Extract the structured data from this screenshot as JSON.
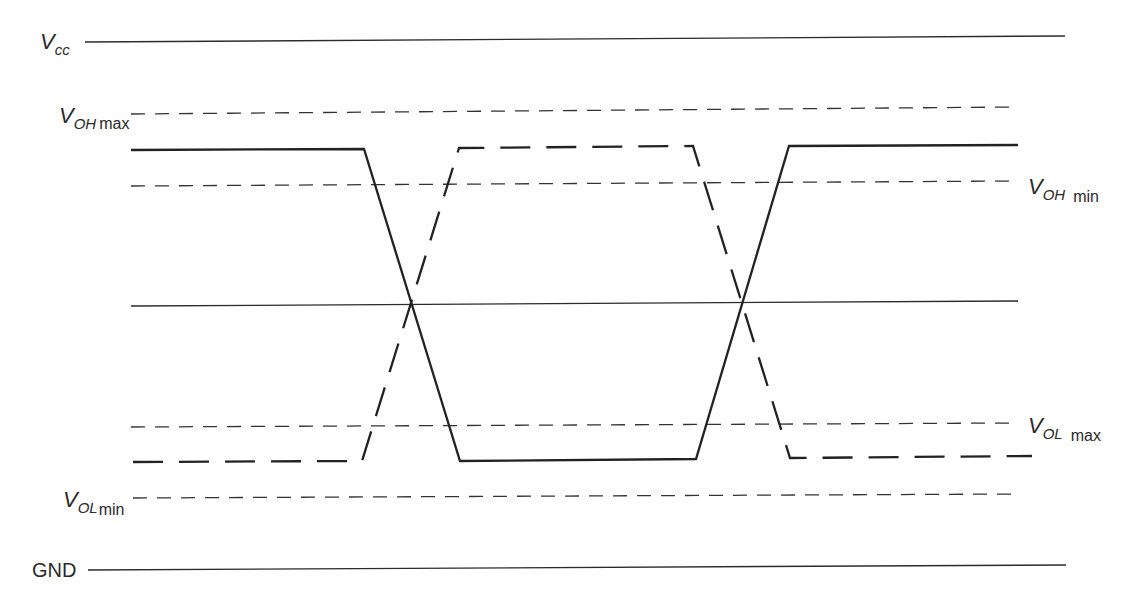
{
  "diagram": {
    "type": "logic-level-timing",
    "rails": {
      "vcc": {
        "main": "V",
        "sub": "CC"
      },
      "gnd": {
        "label": "GND"
      }
    },
    "thresholds": [
      {
        "id": "voh_max",
        "main": "V",
        "sub": "OH",
        "qualifier": "max",
        "side": "left"
      },
      {
        "id": "voh_min",
        "main": "V",
        "sub": "OH",
        "qualifier": "min",
        "side": "right"
      },
      {
        "id": "vol_max",
        "main": "V",
        "sub": "OL",
        "qualifier": "max",
        "side": "right"
      },
      {
        "id": "vol_min",
        "main": "V",
        "sub": "OL",
        "qualifier": "min",
        "side": "left"
      }
    ],
    "signals": [
      {
        "name": "solid-waveform",
        "style": "solid",
        "sequence": [
          "high",
          "falling",
          "low",
          "rising",
          "high"
        ]
      },
      {
        "name": "dashed-waveform",
        "style": "dashed",
        "sequence": [
          "low",
          "rising",
          "high",
          "falling",
          "low"
        ]
      }
    ],
    "colors": {
      "line": "#2b2b2b",
      "background": "#ffffff"
    }
  }
}
